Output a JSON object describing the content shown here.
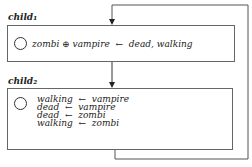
{
  "nodes": [
    {
      "label": "child₁",
      "rules": [
        "zombi ⊕ vampire  ←  dead, walking"
      ]
    },
    {
      "label": "child₂",
      "rules": [
        "walking  ←  vampire",
        "dead  ←  vampire",
        "dead  ←  zombi",
        "walking  ←  zombi"
      ]
    }
  ]
}
